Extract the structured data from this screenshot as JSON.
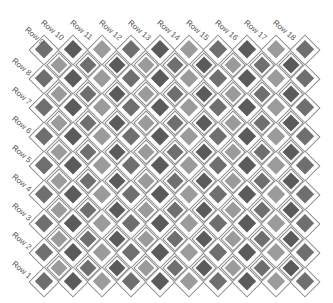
{
  "diagram": {
    "column_labels": [
      "Row 9",
      "Row 10",
      "Row 11",
      "Row 12",
      "Row 13",
      "Row 14",
      "Row 15",
      "Row 16",
      "Row 17",
      "Row 18"
    ],
    "row_labels": [
      "Row 8",
      "Row 7",
      "Row 6",
      "Row 5",
      "Row 4",
      "Row 3",
      "Row 2",
      "Row 1"
    ],
    "grid": {
      "main_rows": 9,
      "main_cols": 10,
      "offset_rows": 8,
      "offset_cols": 9,
      "origin_x": 44,
      "origin_y": 50,
      "spacing": 29
    },
    "colors": {
      "shades": [
        "#6f6f6f",
        "#5b5b5b",
        "#9b9b9b"
      ],
      "outline": "#8a8a8a",
      "label": "#555555"
    },
    "pattern": {
      "main_shade_offset": 0,
      "offset_shade_offset": 2
    }
  }
}
